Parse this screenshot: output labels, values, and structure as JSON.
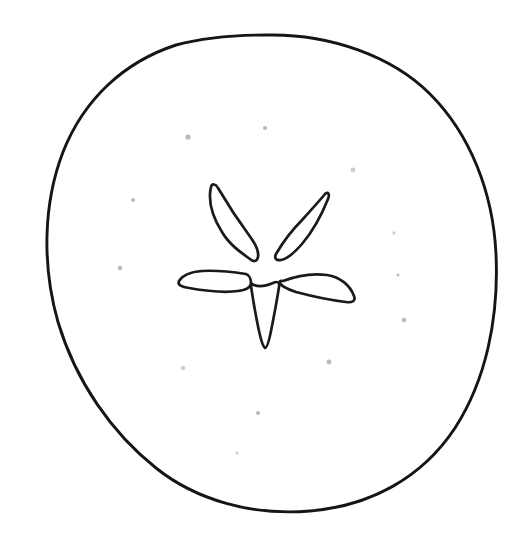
{
  "image": {
    "kind": "line-drawing",
    "title": "Fruit top view with five-lobed calyx",
    "caption": "",
    "background_color": "#ffffff",
    "ink_color": "#1a1a1a",
    "speckle_color": "#b9b9bb",
    "width": 516,
    "height": 536,
    "style": "coloring-book outline, hand drawn, no fill"
  },
  "shapes": {
    "fruit_outline": {
      "name": "fruit-body-outline",
      "description": "Irregular hand-drawn rounded circle filling most of the frame",
      "bounds": {
        "left": 42,
        "top": 35,
        "right": 497,
        "bottom": 512
      },
      "center": {
        "x": 268,
        "y": 273
      },
      "stroke_width": 2.9,
      "path": "M 268 35 C 330 34 392 56 430 94 C 470 134 493 192 496 254 C 499 318 486 380 455 428 C 422 478 370 506 310 511 C 252 516 196 500 156 468 C 112 433 76 382 58 322 C 42 266 43 204 63 152 C 84 99 124 62 176 45 C 206 37 238 35 268 35 Z"
    },
    "calyx": {
      "name": "five-lobed-calyx",
      "description": "Five pointed petals radiating from an open center",
      "center": {
        "x": 266,
        "y": 267
      },
      "petal_count": 5,
      "bounds": {
        "left": 177,
        "top": 184,
        "right": 358,
        "bottom": 350
      },
      "petals": [
        {
          "name": "petal-upper-left",
          "tip": {
            "x": 212,
            "y": 186
          },
          "angle_deg": 198,
          "path": "M 250 259 C 240 252 229 244 222 232 C 212 216 208 200 211 187 C 212 183 216 184 218 188 C 228 205 240 223 251 238 C 256 245 259 252 258 257 C 257 262 253 262 250 259 Z"
        },
        {
          "name": "petal-upper-right",
          "tip": {
            "x": 320,
            "y": 193
          },
          "angle_deg": 310,
          "path": "M 276 254 C 283 242 292 230 303 219 C 312 209 321 199 325 194 C 328 191 330 194 328 199 C 322 214 313 231 302 244 C 295 252 287 259 281 260 C 276 261 274 258 276 254 Z"
        },
        {
          "name": "petal-right",
          "tip": {
            "x": 354,
            "y": 302
          },
          "angle_deg": 20,
          "path": "M 283 281 C 296 276 312 273 327 275 C 340 277 350 285 354 296 C 356 301 352 303 346 302 C 329 300 311 296 296 292 C 287 289 281 286 280 283 C 279 280 281 281 283 281 Z"
        },
        {
          "name": "petal-lower",
          "tip": {
            "x": 262,
            "y": 349
          },
          "angle_deg": 95,
          "path": "M 251 286 C 253 300 256 317 259 331 C 261 340 263 347 265 348 C 267 348 269 341 271 331 C 274 316 277 300 279 287 C 280 282 277 281 273 283 C 266 286 259 287 254 285 C 250 283 250 283 251 286 Z"
        },
        {
          "name": "petal-left",
          "tip": {
            "x": 179,
            "y": 277
          },
          "angle_deg": 160,
          "path": "M 246 274 C 233 272 216 270 202 271 C 190 272 182 276 179 281 C 177 285 182 287 189 288 C 206 291 224 293 238 291 C 246 290 251 287 251 283 C 251 279 249 275 246 274 Z"
        }
      ]
    },
    "speckles": [
      {
        "name": "speck-1",
        "x": 188,
        "y": 137,
        "r": 2.6
      },
      {
        "name": "speck-2",
        "x": 265,
        "y": 128,
        "r": 2.1
      },
      {
        "name": "speck-3",
        "x": 353,
        "y": 170,
        "r": 2.4
      },
      {
        "name": "speck-4",
        "x": 133,
        "y": 200,
        "r": 2.0
      },
      {
        "name": "speck-5",
        "x": 120,
        "y": 268,
        "r": 2.2
      },
      {
        "name": "speck-6",
        "x": 394,
        "y": 233,
        "r": 1.7
      },
      {
        "name": "speck-7",
        "x": 398,
        "y": 275,
        "r": 1.5
      },
      {
        "name": "speck-8",
        "x": 404,
        "y": 320,
        "r": 2.3
      },
      {
        "name": "speck-9",
        "x": 183,
        "y": 368,
        "r": 2.3
      },
      {
        "name": "speck-10",
        "x": 329,
        "y": 362,
        "r": 2.4
      },
      {
        "name": "speck-11",
        "x": 258,
        "y": 413,
        "r": 2.0
      },
      {
        "name": "speck-12",
        "x": 237,
        "y": 453,
        "r": 1.6
      }
    ]
  }
}
